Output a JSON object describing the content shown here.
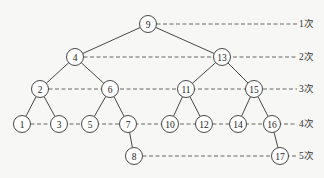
{
  "diagram": {
    "type": "binary-search-tree",
    "nodes": [
      {
        "id": "9",
        "label": "9",
        "x": 148,
        "y": 24,
        "level": 1
      },
      {
        "id": "4",
        "label": "4",
        "x": 75,
        "y": 57,
        "level": 2
      },
      {
        "id": "13",
        "label": "13",
        "x": 222,
        "y": 57,
        "level": 2
      },
      {
        "id": "2",
        "label": "2",
        "x": 40,
        "y": 89,
        "level": 3
      },
      {
        "id": "6",
        "label": "6",
        "x": 110,
        "y": 89,
        "level": 3
      },
      {
        "id": "11",
        "label": "11",
        "x": 186,
        "y": 89,
        "level": 3
      },
      {
        "id": "15",
        "label": "15",
        "x": 254,
        "y": 89,
        "level": 3
      },
      {
        "id": "1",
        "label": "1",
        "x": 22,
        "y": 124,
        "level": 4
      },
      {
        "id": "3",
        "label": "3",
        "x": 59,
        "y": 124,
        "level": 4
      },
      {
        "id": "5",
        "label": "5",
        "x": 90,
        "y": 124,
        "level": 4
      },
      {
        "id": "7",
        "label": "7",
        "x": 128,
        "y": 124,
        "level": 4
      },
      {
        "id": "10",
        "label": "10",
        "x": 170,
        "y": 124,
        "level": 4
      },
      {
        "id": "12",
        "label": "12",
        "x": 204,
        "y": 124,
        "level": 4
      },
      {
        "id": "14",
        "label": "14",
        "x": 238,
        "y": 124,
        "level": 4
      },
      {
        "id": "16",
        "label": "16",
        "x": 272,
        "y": 124,
        "level": 4
      },
      {
        "id": "8",
        "label": "8",
        "x": 134,
        "y": 156,
        "level": 5
      },
      {
        "id": "17",
        "label": "17",
        "x": 280,
        "y": 156,
        "level": 5
      }
    ],
    "edges": [
      [
        "9",
        "4"
      ],
      [
        "9",
        "13"
      ],
      [
        "4",
        "2"
      ],
      [
        "4",
        "6"
      ],
      [
        "13",
        "11"
      ],
      [
        "13",
        "15"
      ],
      [
        "2",
        "1"
      ],
      [
        "2",
        "3"
      ],
      [
        "6",
        "5"
      ],
      [
        "6",
        "7"
      ],
      [
        "11",
        "10"
      ],
      [
        "11",
        "12"
      ],
      [
        "15",
        "14"
      ],
      [
        "15",
        "16"
      ],
      [
        "7",
        "8"
      ],
      [
        "16",
        "17"
      ]
    ],
    "levels": [
      {
        "level": 1,
        "label": "1次",
        "y": 24,
        "from_node": "9"
      },
      {
        "level": 2,
        "label": "2次",
        "y": 57,
        "from_node": "4"
      },
      {
        "level": 3,
        "label": "3次",
        "y": 89,
        "from_node": "2"
      },
      {
        "level": 4,
        "label": "4次",
        "y": 124,
        "from_node": "1"
      },
      {
        "level": 5,
        "label": "5次",
        "y": 156,
        "from_node": "8"
      }
    ],
    "label_x": 299,
    "node_radius": 8.5
  }
}
